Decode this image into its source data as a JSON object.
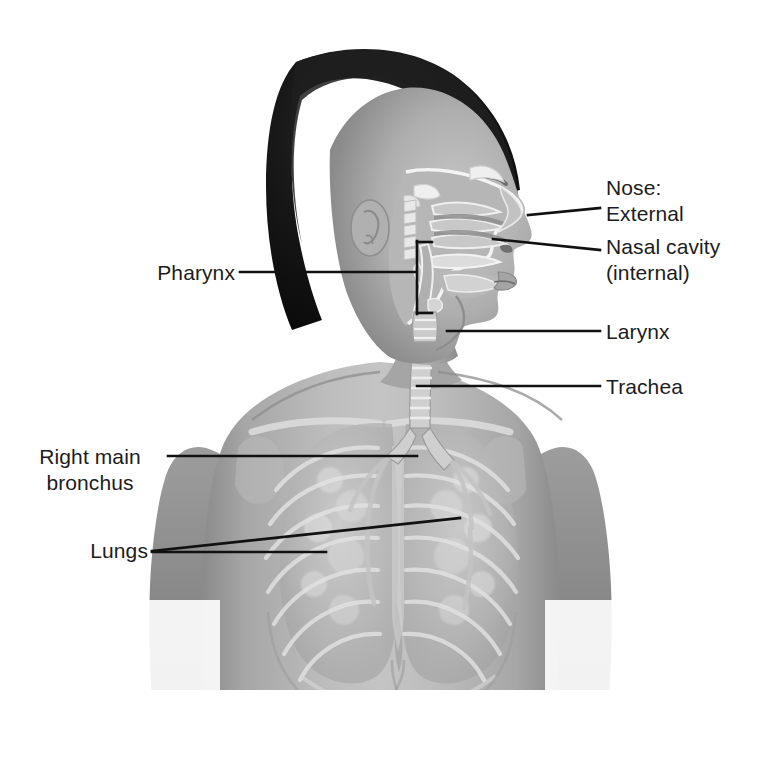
{
  "figure": {
    "background_color": "#ffffff",
    "label_color": "#1c1c1c",
    "leader_color": "#111111",
    "width": 761,
    "height": 783
  },
  "labels": {
    "nose_heading": "Nose:",
    "nose_external": "External",
    "nose_nasal_cavity": "Nasal cavity",
    "nose_nasal_cavity_sub": "(internal)",
    "pharynx": "Pharynx",
    "larynx": "Larynx",
    "trachea": "Trachea",
    "right_main_bronchus_line1": "Right main",
    "right_main_bronchus_line2": "bronchus",
    "lungs": "Lungs"
  },
  "structures": [
    {
      "name": "Nose: External",
      "side": "right",
      "label_x": 608,
      "label_y": 213
    },
    {
      "name": "Nasal cavity (internal)",
      "side": "right",
      "label_x": 608,
      "label_y": 245
    },
    {
      "name": "Pharynx",
      "side": "left",
      "label_x": 237,
      "label_y": 272
    },
    {
      "name": "Larynx",
      "side": "right",
      "label_x": 608,
      "label_y": 332
    },
    {
      "name": "Trachea",
      "side": "right",
      "label_x": 608,
      "label_y": 386
    },
    {
      "name": "Right main bronchus",
      "side": "left",
      "label_x": 155,
      "label_y": 456
    },
    {
      "name": "Lungs",
      "side": "left",
      "label_x": 155,
      "label_y": 550
    }
  ],
  "palette": {
    "hair_dark": "#131313",
    "skin_mid": "#9a9a9a",
    "skin_light": "#c8c8c8",
    "skin_shadow": "#6e6e6e",
    "organ_light": "#d5d5d5",
    "organ_mid": "#a8a8a8",
    "line_black": "#111111"
  }
}
